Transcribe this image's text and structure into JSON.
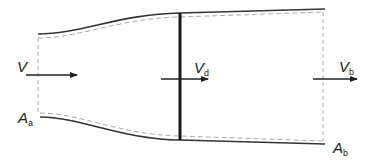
{
  "diagram": {
    "labels": {
      "freestream_velocity": {
        "main": "V",
        "sub": ""
      },
      "disk_velocity": {
        "main": "V",
        "sub": "d"
      },
      "wake_velocity": {
        "main": "V",
        "sub": "b"
      },
      "inlet_area": {
        "main": "A",
        "sub": "a"
      },
      "outlet_area": {
        "main": "A",
        "sub": "b"
      }
    },
    "colors": {
      "stroke": "#333333",
      "dashed": "#aaaaaa",
      "disk": "#1a1a1a"
    }
  }
}
